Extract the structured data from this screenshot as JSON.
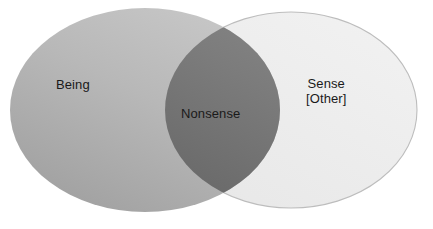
{
  "diagram": {
    "type": "venn",
    "title": "",
    "background_color": "#ffffff",
    "sets": [
      {
        "id": "left",
        "label": "Being",
        "fill_color": "#b0b0b0",
        "gradient_from": "#c4c4c4",
        "gradient_to": "#a2a2a2",
        "stroke_color": "none",
        "center_x": 145,
        "center_y": 110,
        "radius_x": 135,
        "radius_y": 102
      },
      {
        "id": "right",
        "label_lines": [
          "Sense",
          "[Other]"
        ],
        "label": "Sense",
        "label_secondary": "[Other]",
        "fill_color": "#eeeeee",
        "stroke_color": "#bdbdbd",
        "center_x": 291,
        "center_y": 110,
        "radius_x": 126,
        "radius_y": 98
      }
    ],
    "intersection": {
      "id": "overlap",
      "label": "Nonsense",
      "fill_color": "#787878",
      "gradient_from": "#868686",
      "gradient_to": "#6d6d6d",
      "top_vertex_x": 206,
      "top_vertex_y": 33,
      "bottom_vertex_x": 208,
      "bottom_vertex_y": 197,
      "left_extent_x": 172,
      "right_extent_x": 272
    },
    "label_color": "#1a1a1a"
  }
}
